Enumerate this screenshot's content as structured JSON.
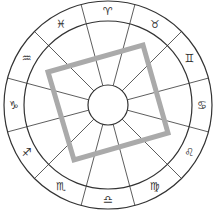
{
  "diagram": {
    "type": "zodiac-wheel",
    "center": [
      108,
      105
    ],
    "outer_radius": 104,
    "middle_radius": 84,
    "inner_radius": 20,
    "line_color": "#333333",
    "square_color": "#aaaaaa",
    "square": {
      "corners": [
        [
          48,
          72
        ],
        [
          143,
          45
        ],
        [
          168,
          133
        ],
        [
          74,
          160
        ]
      ]
    },
    "signs": [
      {
        "name": "Aries",
        "glyph": "♈",
        "angle": 0
      },
      {
        "name": "Pisces",
        "glyph": "♓",
        "angle": 30
      },
      {
        "name": "Aquarius",
        "glyph": "♒",
        "angle": 60
      },
      {
        "name": "Capricorn",
        "glyph": "♑",
        "angle": 90
      },
      {
        "name": "Sagittarius",
        "glyph": "♐",
        "angle": 120
      },
      {
        "name": "Scorpio",
        "glyph": "♏",
        "angle": 150
      },
      {
        "name": "Libra",
        "glyph": "♎",
        "angle": 180
      },
      {
        "name": "Virgo",
        "glyph": "♍",
        "angle": 210
      },
      {
        "name": "Leo",
        "glyph": "♌",
        "angle": 240
      },
      {
        "name": "Cancer",
        "glyph": "♋",
        "angle": 270
      },
      {
        "name": "Gemini",
        "glyph": "♊",
        "angle": 300
      },
      {
        "name": "Taurus",
        "glyph": "♉",
        "angle": 330
      }
    ]
  }
}
